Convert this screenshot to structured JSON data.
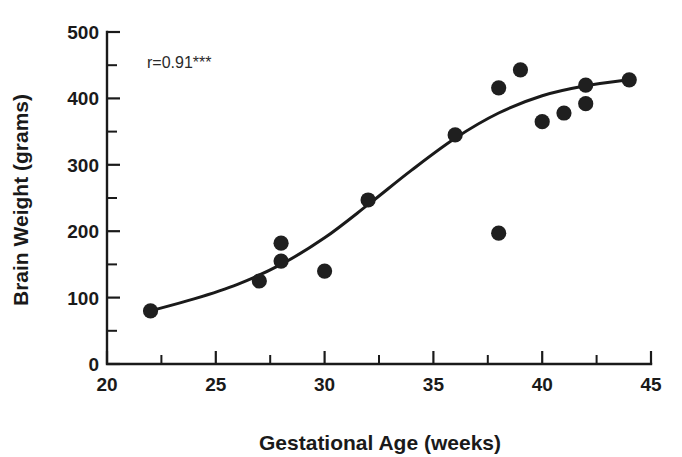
{
  "chart_data": {
    "type": "scatter",
    "title": "",
    "xlabel": "Gestational Age (weeks)",
    "ylabel": "Brain Weight (grams)",
    "xlim": [
      20,
      45
    ],
    "ylim": [
      0,
      500
    ],
    "grid": false,
    "legend": "none",
    "x_ticks": [
      20,
      25,
      30,
      35,
      40,
      45
    ],
    "x_tick_labels": [
      "20",
      "25",
      "30",
      "35",
      "40",
      "45"
    ],
    "x_minor_tick_interval": 2.5,
    "y_ticks": [
      0,
      100,
      200,
      300,
      400,
      500
    ],
    "y_tick_labels": [
      "0",
      "100",
      "200",
      "300",
      "400",
      "500"
    ],
    "y_minor_tick_interval": 50,
    "marker": "filled-circle",
    "marker_color": "#1f1f1f",
    "curve_color": "#1a1a1a",
    "axis_color": "#1a1a1a",
    "background_color": "#ffffff",
    "x": [
      22,
      27,
      28,
      28,
      30,
      32,
      36,
      38,
      38,
      39,
      40,
      41,
      42,
      42,
      44
    ],
    "y": [
      80,
      125,
      155,
      182,
      140,
      247,
      345,
      197,
      416,
      443,
      365,
      378,
      392,
      420,
      428
    ],
    "points": [
      {
        "x": 22,
        "y": 80
      },
      {
        "x": 27,
        "y": 125
      },
      {
        "x": 28,
        "y": 155
      },
      {
        "x": 28,
        "y": 182
      },
      {
        "x": 30,
        "y": 140
      },
      {
        "x": 32,
        "y": 247
      },
      {
        "x": 36,
        "y": 345
      },
      {
        "x": 38,
        "y": 197
      },
      {
        "x": 38,
        "y": 416
      },
      {
        "x": 39,
        "y": 443
      },
      {
        "x": 40,
        "y": 365
      },
      {
        "x": 41,
        "y": 378
      },
      {
        "x": 42,
        "y": 392
      },
      {
        "x": 42,
        "y": 420
      },
      {
        "x": 44,
        "y": 428
      }
    ],
    "fit_curve": {
      "name": "sigmoid-fit",
      "x": [
        22,
        24,
        26,
        28,
        30,
        32,
        34,
        36,
        38,
        40,
        42,
        44
      ],
      "y": [
        80,
        98,
        120,
        150,
        190,
        240,
        292,
        340,
        378,
        404,
        419,
        428
      ]
    },
    "annotations": [
      {
        "name": "correlation-annotation",
        "text": "r=0.91***",
        "x": 23.8,
        "y": 455
      }
    ]
  }
}
